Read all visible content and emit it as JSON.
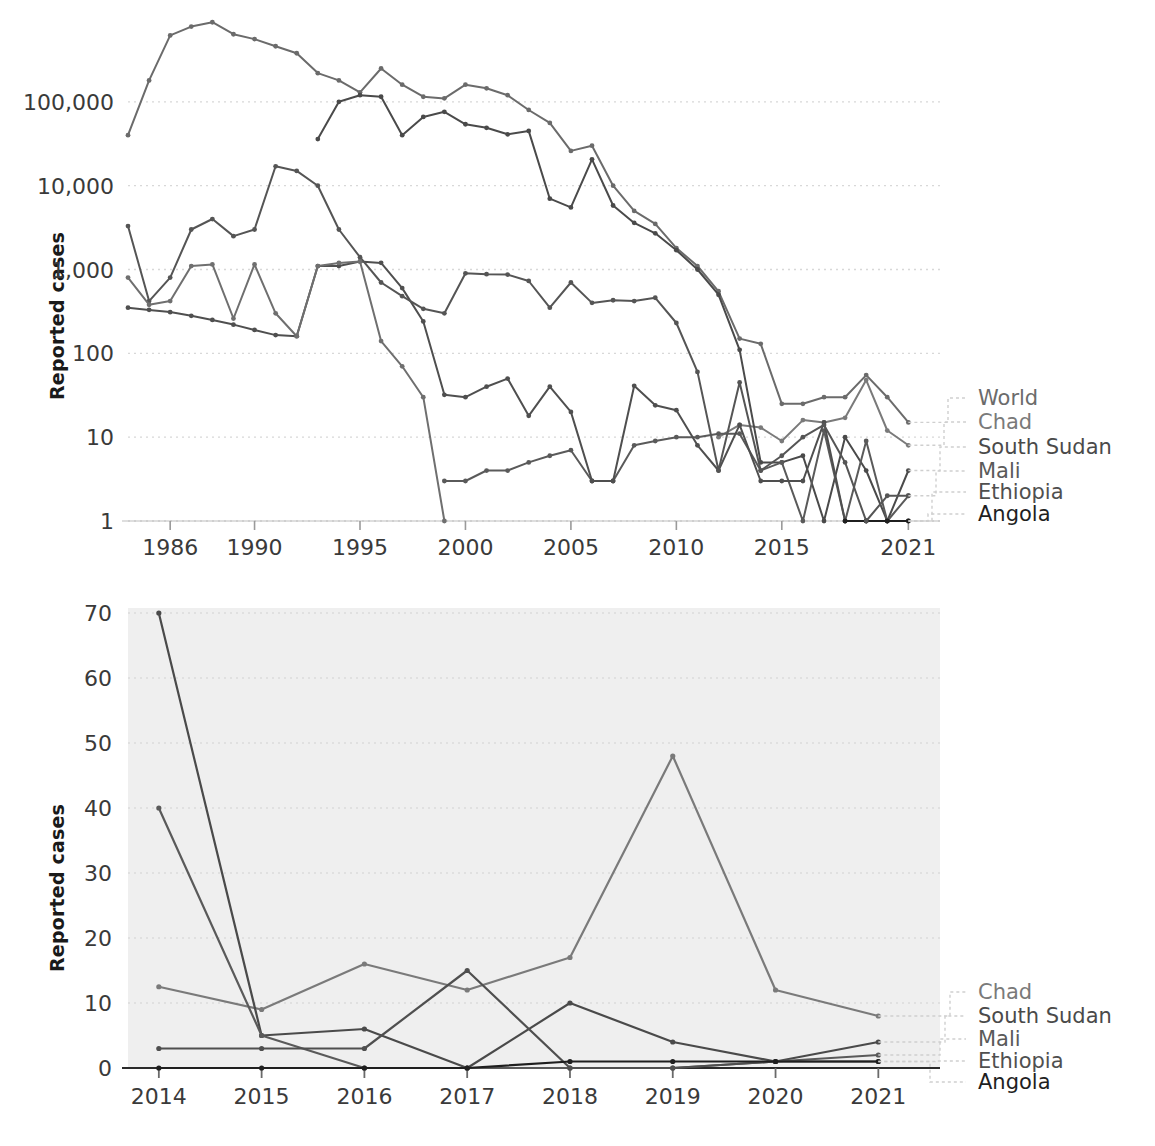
{
  "figure": {
    "background": "#ffffff",
    "panel_count": 2
  },
  "chart_data": [
    {
      "id": "top",
      "type": "line",
      "title": "",
      "subtitle": "",
      "xlabel": "",
      "ylabel": "Reported cases",
      "yscale": "log",
      "xscale": "linear",
      "xlim": [
        1984,
        2022.5
      ],
      "ylim": [
        1,
        1000000
      ],
      "xticks": [
        1986,
        1990,
        1995,
        2000,
        2005,
        2010,
        2015,
        2021
      ],
      "xticklabels": [
        "1986",
        "1990",
        "1995",
        "2000",
        "2005",
        "2010",
        "2015",
        "2021"
      ],
      "yticks": [
        1,
        10,
        100,
        1000,
        10000,
        100000
      ],
      "yticklabels": [
        "1",
        "10",
        "100",
        "1,000",
        "10,000",
        "100,000"
      ],
      "grid": true,
      "grid_style": "dotted-horizontal",
      "legend_position": "right-outside",
      "plot_background": "#ffffff",
      "x": [
        1984,
        1985,
        1986,
        1987,
        1988,
        1989,
        1990,
        1991,
        1992,
        1993,
        1994,
        1995,
        1996,
        1997,
        1998,
        1999,
        2000,
        2001,
        2002,
        2003,
        2004,
        2005,
        2006,
        2007,
        2008,
        2009,
        2010,
        2011,
        2012,
        2013,
        2014,
        2015,
        2016,
        2017,
        2018,
        2019,
        2020,
        2021,
        2022
      ],
      "series": [
        {
          "name": "World",
          "color": "#6b6b6b",
          "values": [
            40000,
            180000,
            620000,
            790000,
            890000,
            640000,
            560000,
            460000,
            380000,
            220000,
            180000,
            130000,
            250000,
            160000,
            115000,
            110000,
            160000,
            145000,
            120000,
            80000,
            56000,
            26000,
            30000,
            10000,
            5000,
            3500,
            1800,
            1100,
            550,
            150,
            130,
            25,
            25,
            30,
            30,
            55,
            30,
            15,
            null
          ]
        },
        {
          "name": "Chad",
          "color": "#7a7a7a",
          "values": [
            null,
            null,
            null,
            null,
            null,
            null,
            null,
            null,
            null,
            null,
            null,
            null,
            null,
            null,
            null,
            null,
            null,
            null,
            null,
            null,
            null,
            null,
            null,
            null,
            null,
            null,
            null,
            null,
            10,
            14,
            13,
            9,
            16,
            15,
            17,
            48,
            12,
            8,
            null
          ]
        },
        {
          "name": "South Sudan",
          "color": "#4a4a4a",
          "values": [
            null,
            null,
            null,
            null,
            null,
            null,
            null,
            null,
            null,
            36000,
            100000,
            120000,
            115000,
            40000,
            66000,
            76000,
            54000,
            49000,
            41000,
            45000,
            7000,
            5500,
            20600,
            5800,
            3600,
            2700,
            1700,
            1000,
            500,
            110,
            5,
            5,
            6,
            0,
            10,
            4,
            1,
            4,
            null
          ]
        },
        {
          "name": "Mali",
          "color": "#5a5a5a",
          "values": [
            null,
            null,
            null,
            null,
            null,
            null,
            null,
            null,
            null,
            null,
            null,
            null,
            null,
            null,
            null,
            3,
            3,
            4,
            4,
            5,
            6,
            7,
            3,
            3,
            8,
            9,
            10,
            10,
            11,
            11,
            4,
            5,
            0,
            12,
            0,
            9,
            1,
            2,
            null
          ]
        },
        {
          "name": "Ethiopia",
          "color": "#4f4f4f",
          "values": [
            350,
            330,
            310,
            280,
            250,
            220,
            190,
            165,
            160,
            1100,
            1100,
            1250,
            1200,
            600,
            240,
            32,
            30,
            40,
            50,
            18,
            40,
            20,
            3,
            3,
            41,
            24,
            21,
            8,
            4,
            14,
            3,
            3,
            3,
            15,
            0,
            0,
            1,
            1,
            null
          ]
        },
        {
          "name": "Angola",
          "color": "#1f1f1f",
          "values": [
            null,
            null,
            null,
            null,
            null,
            null,
            null,
            null,
            null,
            null,
            null,
            null,
            null,
            null,
            null,
            null,
            null,
            null,
            null,
            null,
            null,
            null,
            null,
            null,
            null,
            null,
            null,
            null,
            null,
            null,
            null,
            null,
            null,
            null,
            1,
            1,
            1,
            1,
            null
          ]
        },
        {
          "name": "Series-A",
          "color": "#555555",
          "values": [
            3300,
            420,
            800,
            3000,
            4000,
            2500,
            3000,
            17000,
            15000,
            10000,
            3000,
            1400,
            700,
            480,
            340,
            300,
            900,
            880,
            870,
            730,
            350,
            700,
            400,
            430,
            420,
            460,
            230,
            60,
            4,
            45,
            4,
            6,
            10,
            14,
            5,
            1,
            2,
            2,
            null
          ]
        },
        {
          "name": "Series-B",
          "color": "#6f6f6f",
          "values": [
            800,
            380,
            420,
            1100,
            1150,
            260,
            1150,
            300,
            160,
            1100,
            1200,
            1250,
            140,
            70,
            30,
            1,
            null,
            null,
            null,
            null,
            null,
            null,
            null,
            null,
            null,
            null,
            null,
            null,
            null,
            null,
            null,
            null,
            null,
            null,
            null,
            null,
            null,
            null,
            null
          ]
        }
      ],
      "legend": [
        {
          "label": "World",
          "color": "#6b6b6b"
        },
        {
          "label": "Chad",
          "color": "#7a7a7a"
        },
        {
          "label": "South Sudan",
          "color": "#4a4a4a"
        },
        {
          "label": "Mali",
          "color": "#5a5a5a"
        },
        {
          "label": "Ethiopia",
          "color": "#4f4f4f"
        },
        {
          "label": "Angola",
          "color": "#1f1f1f"
        }
      ]
    },
    {
      "id": "bottom",
      "type": "line",
      "title": "",
      "subtitle": "",
      "xlabel": "",
      "ylabel": "Reported cases",
      "yscale": "linear",
      "xscale": "linear",
      "xlim": [
        2013.7,
        2021.6
      ],
      "ylim": [
        0,
        70
      ],
      "xticks": [
        2014,
        2015,
        2016,
        2017,
        2018,
        2019,
        2020,
        2021
      ],
      "xticklabels": [
        "2014",
        "2015",
        "2016",
        "2017",
        "2018",
        "2019",
        "2020",
        "2021"
      ],
      "yticks": [
        0,
        10,
        20,
        30,
        40,
        50,
        60,
        70
      ],
      "yticklabels": [
        "0",
        "10",
        "20",
        "30",
        "40",
        "50",
        "60",
        "70"
      ],
      "grid": true,
      "grid_style": "dotted-horizontal",
      "legend_position": "right-outside",
      "plot_background": "#efefef",
      "x": [
        2014,
        2015,
        2016,
        2017,
        2018,
        2019,
        2020,
        2021
      ],
      "series": [
        {
          "name": "Chad",
          "color": "#7a7a7a",
          "values": [
            12.5,
            9,
            16,
            12,
            17,
            48,
            12,
            8
          ]
        },
        {
          "name": "South Sudan",
          "color": "#4a4a4a",
          "values": [
            70,
            5,
            6,
            0,
            10,
            4,
            1,
            4
          ]
        },
        {
          "name": "Mali",
          "color": "#5a5a5a",
          "values": [
            40,
            5,
            0,
            0,
            0,
            0,
            1,
            2
          ]
        },
        {
          "name": "Ethiopia",
          "color": "#4f4f4f",
          "values": [
            3,
            3,
            3,
            15,
            0,
            0,
            1,
            1
          ]
        },
        {
          "name": "Angola",
          "color": "#1f1f1f",
          "values": [
            0,
            0,
            0,
            0,
            1,
            1,
            1,
            1
          ]
        }
      ],
      "legend": [
        {
          "label": "Chad",
          "color": "#7a7a7a"
        },
        {
          "label": "South Sudan",
          "color": "#4a4a4a"
        },
        {
          "label": "Mali",
          "color": "#5a5a5a"
        },
        {
          "label": "Ethiopia",
          "color": "#4f4f4f"
        },
        {
          "label": "Angola",
          "color": "#1f1f1f"
        }
      ]
    }
  ]
}
